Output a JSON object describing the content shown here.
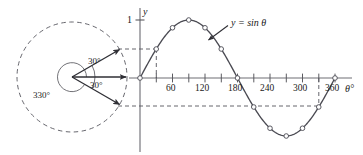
{
  "figure": {
    "title_label": "y = sin θ",
    "axes": {
      "y_axis_label": "y",
      "x_axis_label": "θ°",
      "y_max_label": "1"
    },
    "x_ticks": [
      {
        "value": 0,
        "label": ""
      },
      {
        "value": 30,
        "label": ""
      },
      {
        "value": 60,
        "label": "60"
      },
      {
        "value": 90,
        "label": ""
      },
      {
        "value": 120,
        "label": "120"
      },
      {
        "value": 150,
        "label": ""
      },
      {
        "value": 180,
        "label": "180"
      },
      {
        "value": 210,
        "label": ""
      },
      {
        "value": 240,
        "label": "240"
      },
      {
        "value": 270,
        "label": ""
      },
      {
        "value": 300,
        "label": "300"
      },
      {
        "value": 330,
        "label": ""
      },
      {
        "value": 360,
        "label": "360"
      }
    ],
    "circle_diagram": {
      "reflex_angle_label": "330°",
      "upper_angle_label": "30°",
      "lower_angle_label": "30°"
    },
    "colors": {
      "curve": "#4a4a52",
      "axis": "#6e6e74",
      "dashed": "#55555c",
      "text": "#1a1a1a",
      "marker_fill": "#ffffff",
      "background": "#ffffff"
    }
  },
  "chart_data": {
    "type": "line",
    "title": "y = sin θ",
    "xlabel": "θ°",
    "ylabel": "y",
    "xlim": [
      0,
      360
    ],
    "ylim": [
      -1,
      1
    ],
    "grid": false,
    "legend": "none",
    "annotations": [
      "y = sin θ",
      "330°",
      "30°",
      "30°",
      "1"
    ],
    "x_tick_labels": [
      "60",
      "120",
      "180",
      "240",
      "300",
      "360"
    ],
    "y_tick_labels": [
      "1"
    ],
    "series": [
      {
        "name": "y = sin θ",
        "x": [
          0,
          30,
          60,
          90,
          120,
          150,
          180,
          210,
          240,
          270,
          300,
          330,
          360
        ],
        "values": [
          0,
          0.5,
          0.866,
          1,
          0.866,
          0.5,
          0,
          -0.5,
          -0.866,
          -1,
          -0.866,
          -0.5,
          0
        ]
      }
    ],
    "guide_lines": [
      {
        "type": "horizontal-dashed",
        "y": 0.5,
        "note": "from unit-circle 30° arrow tip to curve point at θ=30"
      },
      {
        "type": "vertical-dashed",
        "x": 30,
        "note": "from curve point at θ=30 down to θ-axis"
      },
      {
        "type": "horizontal-dashed",
        "y": -0.5,
        "note": "from unit-circle 330° arrow tip to curve point at θ=330"
      },
      {
        "type": "vertical-dashed",
        "x": 330,
        "note": "from θ-axis down to curve point at θ=330"
      }
    ]
  }
}
